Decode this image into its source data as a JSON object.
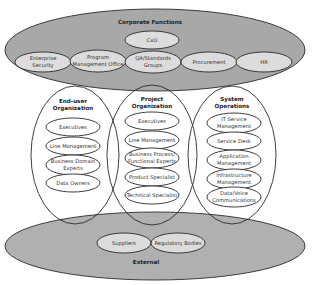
{
  "diagram": {
    "corporate": {
      "title": "Corporate Functions",
      "top_node": "CxO",
      "nodes": [
        {
          "line1": "Enterprise",
          "line2": "Security"
        },
        {
          "line1": "Program",
          "line2": "Management Office"
        },
        {
          "line1": "QA/Standards",
          "line2": "Groups"
        },
        {
          "line1": "Procurement",
          "line2": ""
        },
        {
          "line1": "HR",
          "line2": ""
        }
      ]
    },
    "columns": [
      {
        "title1": "End-user",
        "title2": "Organization",
        "items": [
          {
            "line1": "Executives",
            "line2": ""
          },
          {
            "line1": "Line Management",
            "line2": ""
          },
          {
            "line1": "Business Domain",
            "line2": "Experts"
          },
          {
            "line1": "Data Owners",
            "line2": ""
          }
        ]
      },
      {
        "title1": "Project",
        "title2": "Organization",
        "items": [
          {
            "line1": "Executives",
            "line2": ""
          },
          {
            "line1": "Line Management",
            "line2": ""
          },
          {
            "line1": "Business Process/",
            "line2": "Functional Experts"
          },
          {
            "line1": "Product Specialist",
            "line2": ""
          },
          {
            "line1": "Technical Specialist",
            "line2": ""
          }
        ]
      },
      {
        "title1": "System",
        "title2": "Operations",
        "items": [
          {
            "line1": "IT Service",
            "line2": "Management"
          },
          {
            "line1": "Service Desk",
            "line2": ""
          },
          {
            "line1": "Application",
            "line2": "Management"
          },
          {
            "line1": "Infrastructure",
            "line2": "Management"
          },
          {
            "line1": "Data/Voice",
            "line2": "Communications"
          }
        ]
      }
    ],
    "external": {
      "title": "External",
      "nodes": [
        "Suppliers",
        "Regulatory Bodies"
      ]
    },
    "colors": {
      "outer_fill": "#a8a8a8",
      "inner_fill": "#dcdcdc",
      "stroke": "#2a2a2a"
    }
  }
}
